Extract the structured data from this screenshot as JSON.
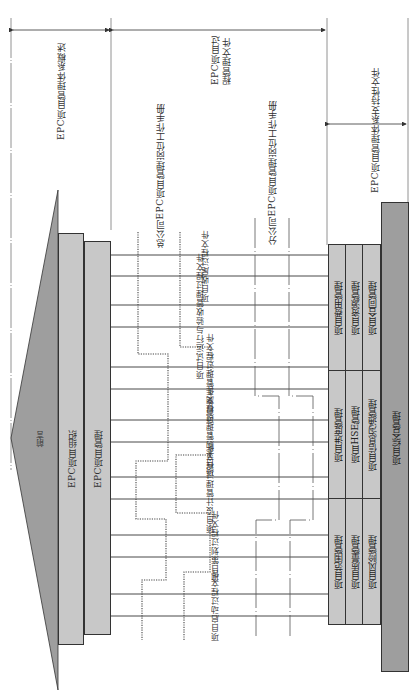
{
  "header_sections": [
    {
      "label": "EPC项目管理体系概述",
      "span": "left"
    },
    {
      "label_line1": "EPC项目过",
      "label_line2": "程管理文件",
      "span": "middle"
    },
    {
      "label": "EPC项目管理体系支持性文件",
      "span": "right"
    }
  ],
  "manuals": {
    "head_office": "总公司EPC项目管理岗位工作手册",
    "branch_office": "分公司EPC项目管理岗位工作手册"
  },
  "left_blocks": {
    "preface": "前言",
    "organization": "EPC项目组织",
    "management": "EPC项目管理"
  },
  "process_documents": [
    "项目收尾过程文件",
    "项目试运行与验收管理过程文件",
    "项目施工管理过程文件",
    "项目采购管理过程文件",
    "项目设计管理过程文件",
    "项目策划过程文件",
    "项目启动过程文件"
  ],
  "support_areas": {
    "top_group": [
      "项目费用管理",
      "项目资源管理",
      "项目合同管理"
    ],
    "middle_group": [
      "项目进度管理",
      "项目HSE管理",
      "项目信息沟通管理"
    ],
    "bottom_group": [
      "项目范围管理",
      "项目质量管理",
      "项目风险管理"
    ],
    "integration": "项目综合管理"
  },
  "colors": {
    "dark_gray": "#9e9e9e",
    "light_gray": "#c8c8c8",
    "line": "#333333"
  }
}
